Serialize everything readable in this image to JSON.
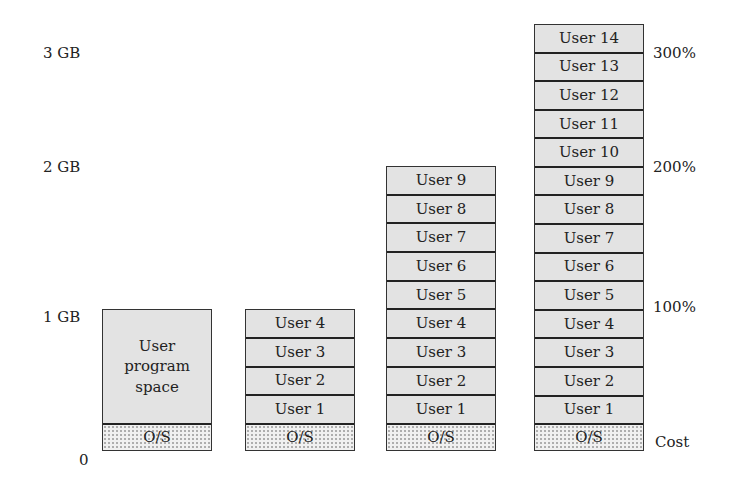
{
  "y_axis": {
    "labels": [
      {
        "text": "3 GB",
        "top": 46
      },
      {
        "text": "2 GB",
        "top": 160
      },
      {
        "text": "1 GB",
        "top": 310
      },
      {
        "text": "0",
        "top": 453
      }
    ]
  },
  "right_axis": {
    "labels": [
      {
        "text": "300%",
        "top": 46
      },
      {
        "text": "200%",
        "top": 160
      },
      {
        "text": "100%",
        "top": 300
      },
      {
        "text": "Cost",
        "top": 435
      }
    ]
  },
  "columns": [
    {
      "name": "config-1",
      "os_label": "O/S",
      "user_space_label": "User program space",
      "users": []
    },
    {
      "name": "config-2",
      "os_label": "O/S",
      "users": [
        "User 4",
        "User 3",
        "User 2",
        "User 1"
      ]
    },
    {
      "name": "config-3",
      "os_label": "O/S",
      "users": [
        "User 9",
        "User 8",
        "User 7",
        "User 6",
        "User 5",
        "User 4",
        "User 3",
        "User 2",
        "User 1"
      ]
    },
    {
      "name": "config-4",
      "os_label": "O/S",
      "users": [
        "User 14",
        "User 13",
        "User 12",
        "User 11",
        "User 10",
        "User 9",
        "User 8",
        "User 7",
        "User 6",
        "User 5",
        "User 4",
        "User 3",
        "User 2",
        "User 1"
      ]
    }
  ]
}
